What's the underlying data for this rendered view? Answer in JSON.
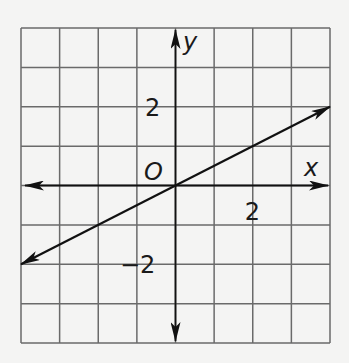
{
  "chart_data": {
    "type": "line",
    "title": "",
    "xlabel": "x",
    "ylabel": "y",
    "origin_label": "O",
    "xlim": [
      -4,
      4
    ],
    "ylim": [
      -4,
      4
    ],
    "grid": true,
    "grid_step": 1,
    "tick_labels": {
      "x": [
        {
          "value": 2,
          "label": "2"
        }
      ],
      "y": [
        {
          "value": 2,
          "label": "2"
        },
        {
          "value": -2,
          "label": "−2"
        }
      ]
    },
    "series": [
      {
        "name": "line",
        "x": [
          -4,
          4
        ],
        "y": [
          -2,
          2
        ],
        "arrows": "both",
        "equation": "y = 0.5x"
      }
    ],
    "legend": null
  }
}
